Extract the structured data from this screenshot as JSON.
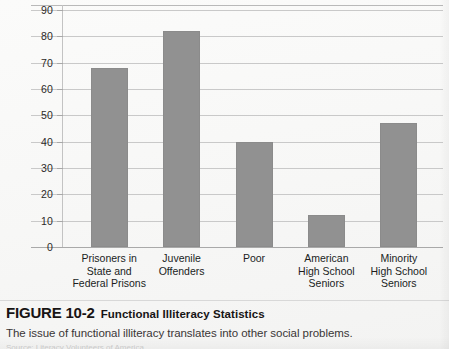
{
  "figure": {
    "number": "FIGURE 10-2",
    "title": "Functional Illiteracy Statistics",
    "description": "The issue of functional illiteracy translates into other social problems.",
    "source_line": "Source: Literacy Volunteers of America"
  },
  "chart_data": {
    "type": "bar",
    "title": "Functional Illiteracy Statistics",
    "xlabel": "",
    "ylabel": "",
    "ylim": [
      0,
      90
    ],
    "yticks": [
      0,
      10,
      20,
      30,
      40,
      50,
      60,
      70,
      80,
      90
    ],
    "ytick_labels": [
      "0",
      "10",
      "20",
      "30",
      "40",
      "50",
      "60",
      "70",
      "80",
      "90"
    ],
    "grid": true,
    "legend": false,
    "bar_color": "#919191",
    "categories": [
      "Prisoners in State and Federal Prisons",
      "Juvenile Offenders",
      "Poor",
      "American High School Seniors",
      "Minority High School Seniors"
    ],
    "category_lines": [
      [
        "Prisoners in",
        "State and",
        "Federal Prisons"
      ],
      [
        "Juvenile",
        "Offenders"
      ],
      [
        "Poor"
      ],
      [
        "American",
        "High School",
        "Seniors"
      ],
      [
        "Minority",
        "High School",
        "Seniors"
      ]
    ],
    "values": [
      68,
      82,
      40,
      12,
      47
    ]
  }
}
